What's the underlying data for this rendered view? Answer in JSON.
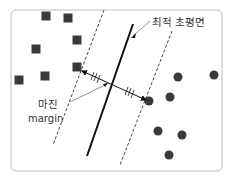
{
  "diagram": {
    "frame": {
      "x": 11,
      "y": 10,
      "w": 211,
      "h": 161,
      "rx": 5,
      "stroke": "#bdbdbd"
    },
    "labels": {
      "hyperplane": "최적 초평면",
      "margin_ko": "마진",
      "margin_en": "margin"
    },
    "colors": {
      "point": "#3a3a3a",
      "line": "#111111",
      "dashed": "#444444",
      "text": "#333333"
    },
    "squares": [
      {
        "x": 46,
        "y": 16
      },
      {
        "x": 68,
        "y": 18
      },
      {
        "x": 77,
        "y": 40
      },
      {
        "x": 36,
        "y": 49
      },
      {
        "x": 77,
        "y": 67
      },
      {
        "x": 45,
        "y": 76
      },
      {
        "x": 19,
        "y": 80
      }
    ],
    "circles": [
      {
        "x": 178,
        "y": 77
      },
      {
        "x": 214,
        "y": 75
      },
      {
        "x": 149,
        "y": 101
      },
      {
        "x": 170,
        "y": 97
      },
      {
        "x": 158,
        "y": 131
      },
      {
        "x": 182,
        "y": 135
      },
      {
        "x": 169,
        "y": 155
      }
    ],
    "hyperplane_line": {
      "x1": 133,
      "y1": 24,
      "x2": 87,
      "y2": 156
    },
    "dashed_left": {
      "x1": 104,
      "y1": 10,
      "x2": 53,
      "y2": 145
    },
    "dashed_right": {
      "x1": 172,
      "y1": 31,
      "x2": 120,
      "y2": 165
    },
    "margin_arrow": {
      "x1": 82,
      "y1": 71,
      "x2": 146,
      "y2": 100
    }
  }
}
